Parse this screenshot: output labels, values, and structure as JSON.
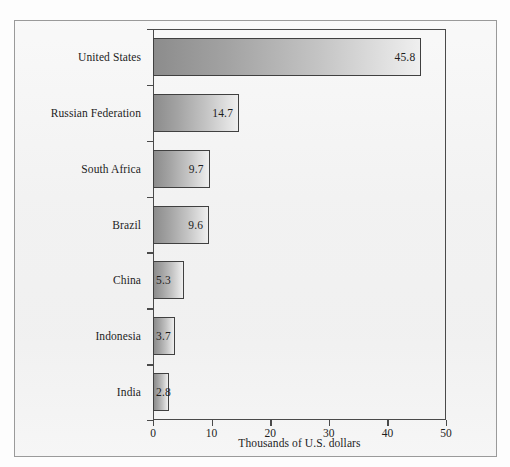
{
  "figure": {
    "background_color": "#f1f1f1",
    "frame_color": "#9a9a9a",
    "axis_color": "#4a4a4a",
    "bar_border_color": "#404040",
    "bar_gradient_start": "#8c8c8c",
    "bar_gradient_end": "#efefef",
    "text_color": "#1d1d1d"
  },
  "chart_data": {
    "type": "bar",
    "orientation": "horizontal",
    "title": "",
    "subtitle": "",
    "xlabel": "Thousands of U.S. dollars",
    "ylabel": "",
    "xlim": [
      0,
      50
    ],
    "xticks": [
      0,
      10,
      20,
      30,
      40,
      50
    ],
    "xtick_labels": [
      "0",
      "10",
      "20",
      "30",
      "40",
      "50"
    ],
    "grid": false,
    "legend": null,
    "categories": [
      "United States",
      "Russian Federation",
      "South Africa",
      "Brazil",
      "China",
      "Indonesia",
      "India"
    ],
    "values": [
      45.8,
      14.7,
      9.7,
      9.6,
      5.3,
      3.7,
      2.8
    ],
    "value_labels": [
      "45.8",
      "14.7",
      "9.7",
      "9.6",
      "5.3",
      "3.7",
      "2.8"
    ],
    "bars": [
      {
        "category": "United States",
        "value": 45.8,
        "label": "45.8"
      },
      {
        "category": "Russian Federation",
        "value": 14.7,
        "label": "14.7"
      },
      {
        "category": "South Africa",
        "value": 9.7,
        "label": "9.7"
      },
      {
        "category": "Brazil",
        "value": 9.6,
        "label": "9.6"
      },
      {
        "category": "China",
        "value": 5.3,
        "label": "5.3"
      },
      {
        "category": "Indonesia",
        "value": 3.7,
        "label": "3.7"
      },
      {
        "category": "India",
        "value": 2.8,
        "label": "2.8"
      }
    ]
  }
}
